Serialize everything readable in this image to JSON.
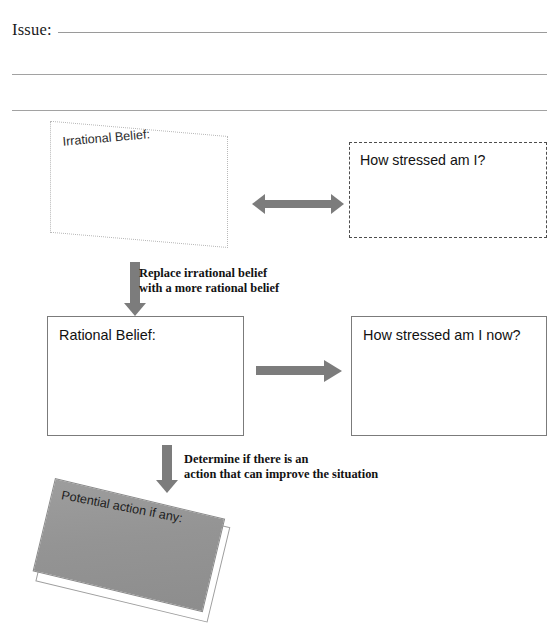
{
  "worksheet": {
    "issue": {
      "label": "Issue:",
      "value": "",
      "placeholder": "",
      "blank_lines": 2
    },
    "nodes": {
      "irrational_belief": {
        "label": "Irrational Belief:",
        "value": "",
        "border_style": "dotted",
        "shape": "skewed-parallelogram"
      },
      "stress_before": {
        "label": "How stressed am I?",
        "value": "",
        "border_style": "dashed",
        "shape": "rectangle"
      },
      "rational_belief": {
        "label": "Rational Belief:",
        "value": "",
        "border_style": "solid",
        "shape": "rectangle"
      },
      "stress_after": {
        "label": "How stressed am I now?",
        "value": "",
        "border_style": "solid",
        "shape": "rectangle"
      },
      "potential_action": {
        "label": "Potential action if any:",
        "value": "",
        "border_style": "solid",
        "shape": "rotated-filled-slab"
      }
    },
    "connectors": {
      "compare_arrow": {
        "name": "double-headed-arrow",
        "direction": "both",
        "caption": ""
      },
      "replace_arrow": {
        "name": "down-arrow",
        "direction": "down",
        "caption_line1": "Replace irrational belief",
        "caption_line2": "with a more rational belief"
      },
      "reassess_arrow": {
        "name": "right-arrow",
        "direction": "right",
        "caption": ""
      },
      "determine_arrow": {
        "name": "down-arrow",
        "direction": "down",
        "caption_line1": "Determine if there is an",
        "caption_line2": "action that can improve the situation"
      }
    },
    "colors": {
      "arrow_gray": "#7c7c7c",
      "slab_gray": "#949494",
      "rule_gray": "#a2a2a2",
      "solid_border": "#7b7b7b",
      "dotted_border": "#b9b9b9",
      "dashed_border": "#4d4d4d",
      "text": "#121212",
      "background": "#ffffff"
    }
  }
}
